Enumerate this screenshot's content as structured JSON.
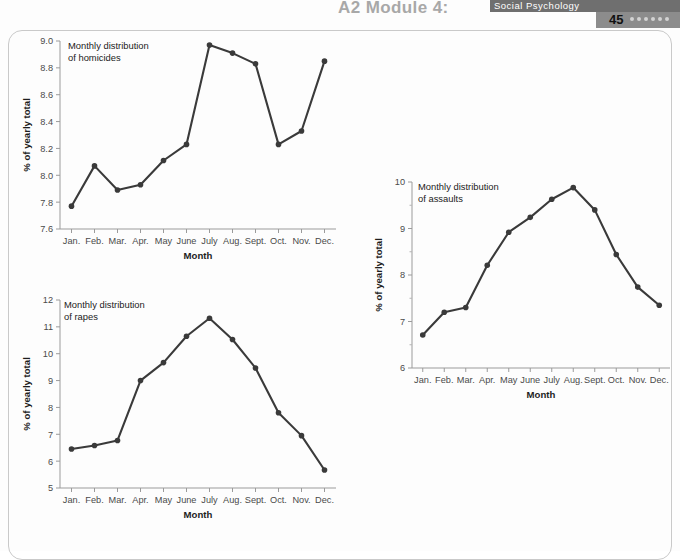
{
  "header": {
    "module_title": "A2 Module 4:",
    "section_title": "Social Psychology",
    "page_number": "45",
    "dot_count": 6
  },
  "months": [
    "Jan.",
    "Feb.",
    "Mar.",
    "Apr.",
    "May",
    "June",
    "July",
    "Aug.",
    "Sept.",
    "Oct.",
    "Nov.",
    "Dec."
  ],
  "axis_titles": {
    "x": "Month",
    "y": "% of yearly total"
  },
  "chart_data": [
    {
      "id": "homicides",
      "type": "line",
      "title": "Monthly distribution of homicides",
      "caption_lines": [
        "Monthly distribution",
        "of homicides"
      ],
      "xlabel": "Month",
      "ylabel": "% of yearly total",
      "categories": [
        "Jan.",
        "Feb.",
        "Mar.",
        "Apr.",
        "May",
        "June",
        "July",
        "Aug.",
        "Sept.",
        "Oct.",
        "Nov.",
        "Dec."
      ],
      "values": [
        7.77,
        8.07,
        7.89,
        7.93,
        8.11,
        8.23,
        8.97,
        8.91,
        8.83,
        8.23,
        8.33,
        8.85
      ],
      "ylim": [
        7.6,
        9.0
      ],
      "yticks": [
        7.6,
        7.8,
        8.0,
        8.2,
        8.4,
        8.6,
        8.8,
        9.0
      ],
      "ytick_labels": [
        "7.6",
        "7.8",
        "8.0",
        "8.2",
        "8.4",
        "8.6",
        "8.8",
        "9.0"
      ],
      "grid": false,
      "legend": "none"
    },
    {
      "id": "rapes",
      "type": "line",
      "title": "Monthly distribution of rapes",
      "caption_lines": [
        "Monthly distribution",
        "of rapes"
      ],
      "xlabel": "Month",
      "ylabel": "% of yearly total",
      "categories": [
        "Jan.",
        "Feb.",
        "Mar.",
        "Apr.",
        "May",
        "June",
        "July",
        "Aug.",
        "Sept.",
        "Oct.",
        "Nov.",
        "Dec."
      ],
      "values": [
        6.45,
        6.58,
        6.77,
        9.0,
        9.67,
        10.65,
        11.32,
        10.53,
        9.47,
        7.8,
        6.95,
        5.67
      ],
      "ylim": [
        5,
        12
      ],
      "yticks": [
        5,
        6,
        7,
        8,
        9,
        10,
        11,
        12
      ],
      "ytick_labels": [
        "5",
        "6",
        "7",
        "8",
        "9",
        "10",
        "11",
        "12"
      ],
      "grid": false,
      "legend": "none"
    },
    {
      "id": "assaults",
      "type": "line",
      "title": "Monthly distribution of assaults",
      "caption_lines": [
        "Monthly distribution",
        "of assaults"
      ],
      "xlabel": "Month",
      "ylabel": "% of yearly total",
      "categories": [
        "Jan.",
        "Feb.",
        "Mar.",
        "Apr.",
        "May",
        "June",
        "July",
        "Aug.",
        "Sept.",
        "Oct.",
        "Nov.",
        "Dec."
      ],
      "values": [
        6.71,
        7.2,
        7.3,
        8.21,
        8.92,
        9.24,
        9.63,
        9.88,
        9.4,
        8.44,
        7.74,
        7.35
      ],
      "ylim": [
        6,
        10
      ],
      "yticks": [
        6,
        7,
        8,
        9,
        10
      ],
      "ytick_labels": [
        "6",
        "7",
        "8",
        "9",
        "10"
      ],
      "minor_yticks": [
        6.5,
        7.5,
        8.5,
        9.5
      ],
      "grid": false,
      "legend": "none"
    }
  ],
  "colors": {
    "line": "#3a3a3a",
    "axis": "#9b9b9b",
    "header_band": "#6f6f6f",
    "header_band_lower": "#8c8c8c",
    "page_dot": "#d3d3d3"
  }
}
